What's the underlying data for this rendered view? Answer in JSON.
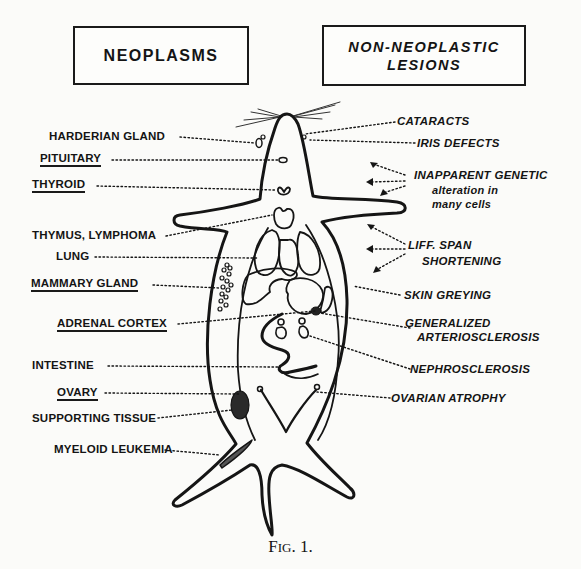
{
  "headers": {
    "neoplasms": "NEOPLASMS",
    "non_neoplastic_line1": "NON-NEOPLASTIC",
    "non_neoplastic_line2": "LESIONS"
  },
  "neoplasm_labels": [
    {
      "text": "HARDERIAN GLAND",
      "underlined": false
    },
    {
      "text": "PITUITARY",
      "underlined": true
    },
    {
      "text": "THYROID",
      "underlined": true
    },
    {
      "text": "THYMUS, LYMPHOMA",
      "underlined": false
    },
    {
      "text": "LUNG",
      "underlined": false
    },
    {
      "text": "MAMMARY GLAND",
      "underlined": true
    },
    {
      "text": "ADRENAL CORTEX",
      "underlined": true
    },
    {
      "text": "INTESTINE",
      "underlined": false
    },
    {
      "text": "OVARY",
      "underlined": true
    },
    {
      "text": "SUPPORTING TISSUE",
      "underlined": false
    },
    {
      "text": "MYELOID LEUKEMIA",
      "underlined": false
    }
  ],
  "lesion_labels": {
    "cataracts": "CATARACTS",
    "iris_defects": "IRIS DEFECTS",
    "inapparent_1": "INAPPARENT GENETIC",
    "inapparent_2": "alteration in",
    "inapparent_3": "many cells",
    "life_span_1": "LIFF. SPAN",
    "life_span_2": "SHORTENING",
    "skin_greying": "SKIN GREYING",
    "generalized_1": "GENERALIZED",
    "generalized_2": "ARTERIOSCLEROSIS",
    "nephrosclerosis": "NEPHROSCLEROSIS",
    "ovarian_atrophy": "OVARIAN ATROPHY"
  },
  "caption": {
    "first": "F",
    "small": "IG",
    "rest": ". 1."
  },
  "colors": {
    "ink": "#141414",
    "paper": "#fbfbf9"
  }
}
